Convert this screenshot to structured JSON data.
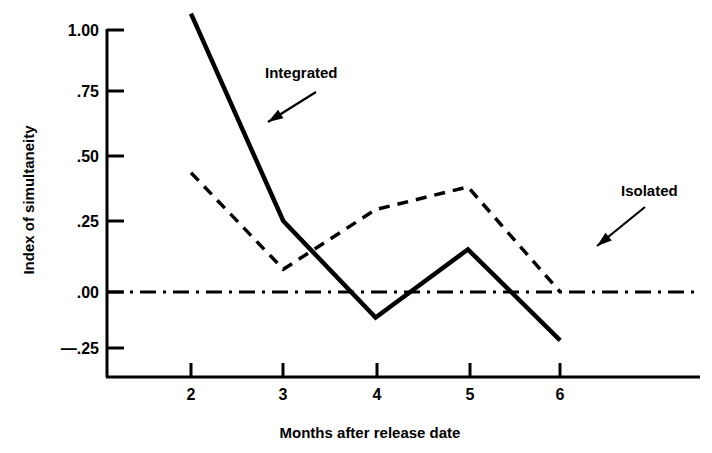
{
  "chart_data": {
    "type": "line",
    "title": "",
    "xlabel": "Months after release date",
    "ylabel": "Index of simultaneity",
    "x": [
      2,
      3,
      4,
      5,
      6
    ],
    "categories": [
      "2",
      "3",
      "4",
      "5",
      "6"
    ],
    "xtick_labels": [
      "2",
      "3",
      "4",
      "5",
      "6"
    ],
    "ytick_labels": [
      "1.00",
      ".75",
      ".50",
      ".25",
      ".00",
      "—.25"
    ],
    "ytick_values": [
      1.0,
      0.75,
      0.5,
      0.25,
      0.0,
      -0.25
    ],
    "xlim": [
      1.65,
      6.45
    ],
    "ylim": [
      -0.33,
      1.03
    ],
    "grid": false,
    "legend_position": "inline-annotations",
    "series": [
      {
        "name": "Integrated",
        "style": "solid",
        "color": "#000000",
        "values": [
          0.98,
          0.25,
          -0.09,
          0.15,
          -0.17
        ]
      },
      {
        "name": "Isolated",
        "style": "dashed",
        "color": "#000000",
        "values": [
          0.42,
          0.08,
          0.29,
          0.37,
          0.0
        ]
      }
    ],
    "reference_line": {
      "name": "zero-line",
      "style": "dash-dot",
      "value": 0.0,
      "color": "#000000"
    },
    "annotations": [
      {
        "name": "Integrated",
        "label_x": 265,
        "label_y": 78,
        "arrow_from_x": 316,
        "arrow_from_y": 92,
        "arrow_to_x": 268,
        "arrow_to_y": 122
      },
      {
        "name": "Isolated",
        "label_x": 621,
        "label_y": 196,
        "arrow_from_x": 645,
        "arrow_from_y": 207,
        "arrow_to_x": 597,
        "arrow_to_y": 246
      }
    ]
  },
  "axis": {
    "y_label_text": "Index of simultaneity",
    "x_label_text": "Months after release date"
  },
  "colors": {
    "ink": "#000000",
    "background": "#ffffff"
  }
}
